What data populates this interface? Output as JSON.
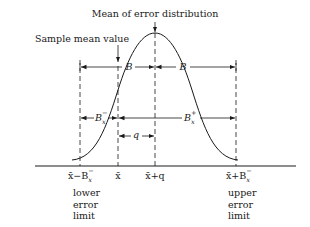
{
  "diagram": {
    "title_annotation": "Mean of error distribution",
    "sample_annotation": "Sample mean value",
    "bias_labels": {
      "left": "B",
      "right": "B"
    },
    "interval_labels": {
      "lower": "B",
      "lower_superscript": "−",
      "upper": "B",
      "upper_superscript": "+",
      "subscript": "x"
    },
    "offset_label": "q",
    "axis_ticks": [
      {
        "id": "lower",
        "text_main": "x̄−B",
        "sup": "−",
        "sub": "x"
      },
      {
        "id": "mean",
        "text_main": "x̄"
      },
      {
        "id": "mean_plus_q",
        "text_main": "x̄+q"
      },
      {
        "id": "upper",
        "text_main": "x̄+B",
        "sup": "−",
        "sub": "x"
      }
    ],
    "lower_limit_text": [
      "lower",
      "error",
      "limit"
    ],
    "upper_limit_text": [
      "upper",
      "error",
      "limit"
    ],
    "colors": {
      "line": "#1a1a1a",
      "background": "#ffffff"
    }
  }
}
